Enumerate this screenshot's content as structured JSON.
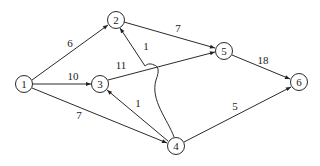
{
  "diagram": {
    "type": "directed-weighted-network",
    "nodes": [
      {
        "id": "1",
        "label": "1",
        "x": 24,
        "y": 84
      },
      {
        "id": "2",
        "label": "2",
        "x": 116,
        "y": 20
      },
      {
        "id": "3",
        "label": "3",
        "x": 100,
        "y": 84
      },
      {
        "id": "4",
        "label": "4",
        "x": 176,
        "y": 146
      },
      {
        "id": "5",
        "label": "5",
        "x": 224,
        "y": 51
      },
      {
        "id": "6",
        "label": "6",
        "x": 299,
        "y": 82
      }
    ],
    "edges": [
      {
        "from": "1",
        "to": "2",
        "weight": "6",
        "label_x": 70,
        "label_y": 47
      },
      {
        "from": "1",
        "to": "3",
        "weight": "10",
        "label_x": 73,
        "label_y": 80
      },
      {
        "from": "1",
        "to": "4",
        "weight": "7",
        "label_x": 79,
        "label_y": 119
      },
      {
        "from": "2",
        "to": "5",
        "weight": "7",
        "label_x": 178,
        "label_y": 32
      },
      {
        "from": "3",
        "to": "5",
        "weight": "11",
        "label_x": 121,
        "label_y": 69
      },
      {
        "from": "4",
        "to": "2",
        "weight": "1",
        "label_x": 146,
        "label_y": 50
      },
      {
        "from": "4",
        "to": "3",
        "weight": "1",
        "label_x": 138,
        "label_y": 107
      },
      {
        "from": "5",
        "to": "6",
        "weight": "18",
        "label_x": 263,
        "label_y": 64
      },
      {
        "from": "4",
        "to": "6",
        "weight": "5",
        "label_x": 235,
        "label_y": 110
      }
    ]
  }
}
